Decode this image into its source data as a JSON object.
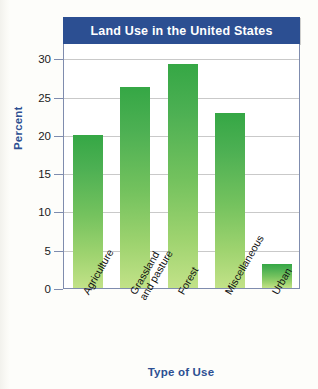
{
  "chart_data": {
    "type": "bar",
    "title": "Land Use in the United States",
    "xlabel": "Type of Use",
    "ylabel": "Percent",
    "categories": [
      "Agriculture",
      "Grassland and pasture",
      "Forest",
      "Miscellaneous",
      "Urban"
    ],
    "category_lines": [
      [
        "Agriculture"
      ],
      [
        "Grassland",
        "and pasture"
      ],
      [
        "Forest"
      ],
      [
        "Miscellaneous"
      ],
      [
        "Urban"
      ]
    ],
    "values": [
      20,
      26.3,
      29.2,
      22.9,
      3.1
    ],
    "ylim": [
      0,
      32
    ],
    "yticks": [
      0,
      5,
      10,
      15,
      20,
      25,
      30
    ],
    "ytick_labels": [
      "0",
      "5",
      "10",
      "15",
      "20",
      "25",
      "30"
    ],
    "grid": true,
    "legend": "none",
    "colors": {
      "title_banner": "#2c4f92",
      "title_text": "#ffffff",
      "axis_title": "#2c4f92",
      "bar_top": "#35a745",
      "bar_bottom": "#c2e288",
      "gridline": "#c9c9c9",
      "frame": "#7f8cae",
      "plot_background": "#ffffff",
      "page_background": "#fdfdfa"
    }
  }
}
